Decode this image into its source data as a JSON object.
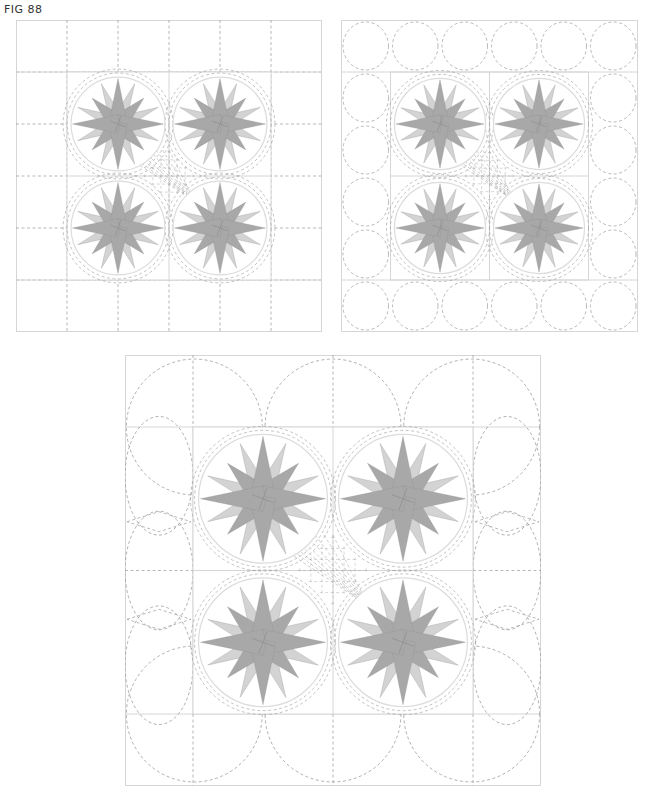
{
  "figure": {
    "label": "FIG 88"
  },
  "colors": {
    "frame_line": "#d6d6d6",
    "quilt_dash": "#9a9a9a",
    "star_dark": "#a8a8a8",
    "star_light": "#d3d3d3",
    "star_edge": "#8f8f8f",
    "ring": "#dcdcdc"
  },
  "panels": [
    {
      "id": "p1",
      "name": "grid-border-layout",
      "border_style": "dashed-grid",
      "grid_columns": 6,
      "grid_rows": 6,
      "blocks": 4,
      "center_quilting": "crosshatch"
    },
    {
      "id": "p2",
      "name": "circle-border-layout",
      "border_style": "dashed-circles",
      "circles_per_side": 6,
      "blocks": 4,
      "center_quilting": "crosshatch"
    },
    {
      "id": "p3",
      "name": "interlocking-arc-border-layout",
      "border_style": "interlocking-arcs",
      "arcs_per_side": 3,
      "blocks": 4,
      "center_quilting": "crosshatch"
    }
  ],
  "star": {
    "points_long": 4,
    "points_diagonal": 4,
    "points_short": 8
  }
}
